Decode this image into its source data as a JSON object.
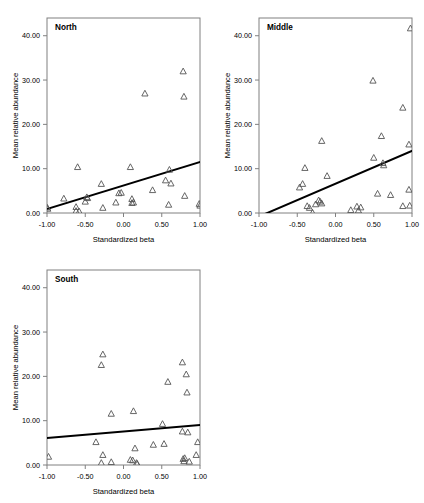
{
  "figure": {
    "name": "three-panel-scatter-regression",
    "panels": [
      "North",
      "Middle",
      "South"
    ]
  },
  "chart_data": [
    {
      "type": "scatter",
      "title": "North",
      "xlabel": "Standardized beta",
      "ylabel": "Mean relative abundance",
      "xlim": [
        -1.0,
        1.0
      ],
      "ylim": [
        0.0,
        44.0
      ],
      "xticks": [
        -1.0,
        -0.5,
        0.0,
        0.5,
        1.0
      ],
      "xticklabels": [
        "-1.00",
        "-0.50",
        "0.00",
        "0.50",
        "1.00"
      ],
      "yticks": [
        0.0,
        10.0,
        20.0,
        30.0,
        40.0
      ],
      "yticklabels": [
        "0.00",
        "10.00",
        "20.00",
        "30.00",
        "40.00"
      ],
      "grid": false,
      "legend": "none",
      "marker": "triangle-up-open",
      "points": [
        {
          "x": -1.0,
          "y": 1.3
        },
        {
          "x": -0.99,
          "y": 1.0
        },
        {
          "x": -0.78,
          "y": 3.3
        },
        {
          "x": -0.62,
          "y": 1.4
        },
        {
          "x": -0.62,
          "y": 0.5
        },
        {
          "x": -0.6,
          "y": 10.4
        },
        {
          "x": -0.58,
          "y": 0.4
        },
        {
          "x": -0.5,
          "y": 2.6
        },
        {
          "x": -0.48,
          "y": 3.6
        },
        {
          "x": -0.47,
          "y": 3.4
        },
        {
          "x": -0.29,
          "y": 6.6
        },
        {
          "x": -0.27,
          "y": 1.2
        },
        {
          "x": -0.1,
          "y": 2.4
        },
        {
          "x": -0.06,
          "y": 4.5
        },
        {
          "x": -0.03,
          "y": 4.6
        },
        {
          "x": 0.09,
          "y": 10.4
        },
        {
          "x": 0.11,
          "y": 3.2
        },
        {
          "x": 0.11,
          "y": 2.3
        },
        {
          "x": 0.13,
          "y": 2.4
        },
        {
          "x": 0.28,
          "y": 27.0
        },
        {
          "x": 0.38,
          "y": 5.2
        },
        {
          "x": 0.55,
          "y": 7.4
        },
        {
          "x": 0.59,
          "y": 1.9
        },
        {
          "x": 0.6,
          "y": 9.8
        },
        {
          "x": 0.62,
          "y": 6.7
        },
        {
          "x": 0.78,
          "y": 32.0
        },
        {
          "x": 0.79,
          "y": 26.3
        },
        {
          "x": 0.8,
          "y": 3.9
        },
        {
          "x": 0.99,
          "y": 2.1
        },
        {
          "x": 1.0,
          "y": 1.7
        }
      ],
      "fit_line": {
        "x0": -1.0,
        "y0": 0.9,
        "x1": 1.0,
        "y1": 11.5
      }
    },
    {
      "type": "scatter",
      "title": "Middle",
      "xlabel": "Standardized beta",
      "ylabel": "Mean relative abundance",
      "xlim": [
        -1.0,
        1.0
      ],
      "ylim": [
        0.0,
        44.0
      ],
      "xticks": [
        -1.0,
        -0.5,
        0.0,
        0.5,
        1.0
      ],
      "xticklabels": [
        "-1.00",
        "-0.50",
        "0.00",
        "0.50",
        "1.00"
      ],
      "yticks": [
        0.0,
        10.0,
        20.0,
        30.0,
        40.0
      ],
      "yticklabels": [
        "0.00",
        "10.00",
        "20.00",
        "30.00",
        "40.00"
      ],
      "grid": false,
      "legend": "none",
      "marker": "triangle-up-open",
      "points": [
        {
          "x": -0.47,
          "y": 5.8
        },
        {
          "x": -0.43,
          "y": 6.6
        },
        {
          "x": -0.4,
          "y": 10.2
        },
        {
          "x": -0.37,
          "y": 1.6
        },
        {
          "x": -0.34,
          "y": 1.2
        },
        {
          "x": -0.3,
          "y": 0.1
        },
        {
          "x": -0.26,
          "y": 2.0
        },
        {
          "x": -0.22,
          "y": 2.9
        },
        {
          "x": -0.2,
          "y": 2.6
        },
        {
          "x": -0.18,
          "y": 16.3
        },
        {
          "x": -0.18,
          "y": 2.2
        },
        {
          "x": -0.11,
          "y": 8.4
        },
        {
          "x": 0.2,
          "y": 0.7
        },
        {
          "x": 0.28,
          "y": 1.5
        },
        {
          "x": 0.3,
          "y": 0.6
        },
        {
          "x": 0.33,
          "y": 1.3
        },
        {
          "x": 0.49,
          "y": 29.9
        },
        {
          "x": 0.5,
          "y": 12.5
        },
        {
          "x": 0.55,
          "y": 4.4
        },
        {
          "x": 0.6,
          "y": 17.4
        },
        {
          "x": 0.62,
          "y": 11.3
        },
        {
          "x": 0.63,
          "y": 10.8
        },
        {
          "x": 0.72,
          "y": 4.1
        },
        {
          "x": 0.88,
          "y": 23.8
        },
        {
          "x": 0.88,
          "y": 1.6
        },
        {
          "x": 0.96,
          "y": 15.5
        },
        {
          "x": 0.96,
          "y": 5.3
        },
        {
          "x": 0.97,
          "y": 1.7
        },
        {
          "x": 0.98,
          "y": 41.7
        }
      ],
      "fit_line": {
        "x0": -1.0,
        "y0": -0.8,
        "x1": 1.0,
        "y1": 14.0
      }
    },
    {
      "type": "scatter",
      "title": "South",
      "xlabel": "Standardized beta",
      "ylabel": "Mean relative abundance",
      "xlim": [
        -1.0,
        1.0
      ],
      "ylim": [
        0.0,
        44.0
      ],
      "xticks": [
        -1.0,
        -0.5,
        0.0,
        0.5,
        1.0
      ],
      "xticklabels": [
        "-1.00",
        "-0.50",
        "0.00",
        "0.50",
        "1.00"
      ],
      "yticks": [
        0.0,
        10.0,
        20.0,
        30.0,
        40.0
      ],
      "yticklabels": [
        "0.00",
        "10.00",
        "20.00",
        "30.00",
        "40.00"
      ],
      "grid": false,
      "legend": "none",
      "marker": "triangle-up-open",
      "points": [
        {
          "x": -0.98,
          "y": 1.9
        },
        {
          "x": -0.36,
          "y": 5.2
        },
        {
          "x": -0.29,
          "y": 22.6
        },
        {
          "x": -0.27,
          "y": 25.0
        },
        {
          "x": -0.27,
          "y": 2.3
        },
        {
          "x": -0.29,
          "y": 0.5
        },
        {
          "x": -0.16,
          "y": 11.6
        },
        {
          "x": -0.16,
          "y": 0.7
        },
        {
          "x": 0.09,
          "y": 1.2
        },
        {
          "x": 0.12,
          "y": 1.1
        },
        {
          "x": 0.13,
          "y": 12.2
        },
        {
          "x": 0.15,
          "y": 3.8
        },
        {
          "x": 0.17,
          "y": 0.5
        },
        {
          "x": 0.18,
          "y": 0.3
        },
        {
          "x": 0.39,
          "y": 4.6
        },
        {
          "x": 0.51,
          "y": 9.3
        },
        {
          "x": 0.53,
          "y": 4.8
        },
        {
          "x": 0.58,
          "y": 18.8
        },
        {
          "x": 0.77,
          "y": 23.2
        },
        {
          "x": 0.77,
          "y": 7.6
        },
        {
          "x": 0.78,
          "y": 1.4
        },
        {
          "x": 0.79,
          "y": 0.9
        },
        {
          "x": 0.8,
          "y": 1.6
        },
        {
          "x": 0.82,
          "y": 20.5
        },
        {
          "x": 0.83,
          "y": 16.4
        },
        {
          "x": 0.84,
          "y": 7.4
        },
        {
          "x": 0.86,
          "y": 0.8
        },
        {
          "x": 0.95,
          "y": 2.3
        },
        {
          "x": 0.97,
          "y": 5.2
        }
      ],
      "fit_line": {
        "x0": -1.0,
        "y0": 6.1,
        "x1": 1.0,
        "y1": 9.0
      }
    }
  ]
}
